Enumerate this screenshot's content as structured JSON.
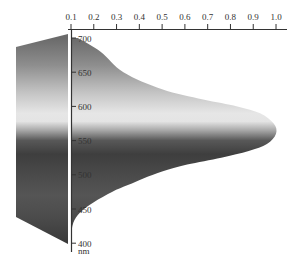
{
  "chart_data": {
    "type": "area",
    "title": "",
    "orientation": "horizontal-values, vertical-wavelength",
    "xlabel": "",
    "ylabel": "nm",
    "x_axis": {
      "position": "top",
      "range": [
        0.1,
        1.0
      ],
      "ticks": [
        "0.1",
        "0.2",
        "0.3",
        "0.4",
        "0.5",
        "0.6",
        "0.7",
        "0.8",
        "0.9",
        "1.0"
      ]
    },
    "y_axis": {
      "range": [
        400,
        700
      ],
      "ticks": [
        "700",
        "650",
        "600",
        "550",
        "500",
        "450",
        "400"
      ],
      "unit_label": "nm"
    },
    "series": [
      {
        "name": "relative sensitivity",
        "wavelength": [
          700,
          680,
          650,
          625,
          610,
          600,
          590,
          575,
          560,
          545,
          535,
          525,
          515,
          505,
          495,
          485,
          475,
          460,
          445,
          430,
          410,
          400
        ],
        "values": [
          0.13,
          0.23,
          0.33,
          0.5,
          0.68,
          0.83,
          0.93,
          0.99,
          1.0,
          0.96,
          0.88,
          0.76,
          0.61,
          0.5,
          0.42,
          0.35,
          0.28,
          0.2,
          0.14,
          0.11,
          0.1,
          0.1
        ]
      }
    ],
    "spectrum_panel": {
      "description": "grayscale spectrum band left of the axis",
      "top_wavelength_left": 686,
      "bottom_wavelength_left": 440
    },
    "grid": false,
    "legend": null,
    "colors": {
      "gradient_stops": [
        {
          "nm": 700,
          "color": "#6a6a6a"
        },
        {
          "nm": 660,
          "color": "#8e8e8e"
        },
        {
          "nm": 620,
          "color": "#c4c4c4"
        },
        {
          "nm": 590,
          "color": "#e6e6e6"
        },
        {
          "nm": 578,
          "color": "#e4e4e4"
        },
        {
          "nm": 565,
          "color": "#a8a8a8"
        },
        {
          "nm": 550,
          "color": "#585858"
        },
        {
          "nm": 530,
          "color": "#3e3e3e"
        },
        {
          "nm": 500,
          "color": "#4a4a4a"
        },
        {
          "nm": 470,
          "color": "#555555"
        },
        {
          "nm": 440,
          "color": "#4c4c4c"
        },
        {
          "nm": 400,
          "color": "#3a3a3a"
        }
      ],
      "axis": "#333333",
      "divider": "#ffffff"
    }
  }
}
